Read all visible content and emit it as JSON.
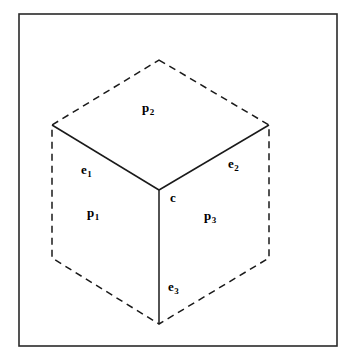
{
  "figure": {
    "frame": {
      "x": 19,
      "y": 14,
      "width": 318,
      "height": 332,
      "stroke_color": "#2a2a2a",
      "stroke_width": 1.6
    },
    "geometry": {
      "center_vertex": {
        "name": "c",
        "x": 159,
        "y": 190
      },
      "hexagon_vertices": [
        {
          "name": "top-apex",
          "x": 159,
          "y": 60
        },
        {
          "name": "upper-right",
          "x": 269,
          "y": 125
        },
        {
          "name": "lower-right",
          "x": 269,
          "y": 258
        },
        {
          "name": "bottom-apex",
          "x": 159,
          "y": 324
        },
        {
          "name": "lower-left",
          "x": 52,
          "y": 258
        },
        {
          "name": "upper-left",
          "x": 52,
          "y": 125
        }
      ],
      "silhouette_path": "M 159 60 L 269 125 L 269 258 L 159 324 L 52 258 L 52 125 Z",
      "silhouette_style": "dashed",
      "dash_pattern": "7 5",
      "interior_edges": [
        {
          "id": "e1",
          "from": "upper-left",
          "to": "c",
          "path": "M 52 125 L 159 190",
          "style": "solid"
        },
        {
          "id": "e2",
          "from": "upper-right",
          "to": "c",
          "path": "M 269 125 L 159 190",
          "style": "solid"
        },
        {
          "id": "e3",
          "from": "bottom-apex",
          "to": "c",
          "path": "M 159 324 L 159 190",
          "style": "solid"
        }
      ],
      "faces": [
        {
          "id": "p1",
          "name": "left-face",
          "path": "M 52 125 L 159 190 L 159 324 L 52 258 Z"
        },
        {
          "id": "p2",
          "name": "top-face",
          "path": "M 159 60 L 269 125 L 159 190 L 52 125 Z"
        },
        {
          "id": "p3",
          "name": "right-face",
          "path": "M 269 125 L 269 258 L 159 324 L 159 190 Z"
        }
      ],
      "line_color": "#1a1a1a",
      "line_width": 1.5,
      "fill_color": "#ffffff"
    },
    "labels": [
      {
        "id": "label-p2",
        "base": "p",
        "sub": "2",
        "x": 142,
        "y": 99,
        "target": "p2",
        "kind": "face"
      },
      {
        "id": "label-e1",
        "base": "e",
        "sub": "1",
        "x": 81,
        "y": 161,
        "target": "e1",
        "kind": "edge"
      },
      {
        "id": "label-e2",
        "base": "e",
        "sub": "2",
        "x": 228,
        "y": 155,
        "target": "e2",
        "kind": "edge"
      },
      {
        "id": "label-c",
        "base": "c",
        "sub": "",
        "x": 170,
        "y": 189,
        "target": "c",
        "kind": "vertex"
      },
      {
        "id": "label-p1",
        "base": "p",
        "sub": "1",
        "x": 87,
        "y": 204,
        "target": "p1",
        "kind": "face"
      },
      {
        "id": "label-p3",
        "base": "p",
        "sub": "3",
        "x": 204,
        "y": 207,
        "target": "p3",
        "kind": "face"
      },
      {
        "id": "label-e3",
        "base": "e",
        "sub": "3",
        "x": 168,
        "y": 278,
        "target": "e3",
        "kind": "edge"
      }
    ],
    "caption": {
      "text": "",
      "visible": false,
      "note": "A caption line is cropped at the very bottom edge and is not legible."
    },
    "colors": {
      "background": "#ffffff",
      "ink": "#000000",
      "frame": "#2a2a2a",
      "line": "#1a1a1a"
    }
  }
}
